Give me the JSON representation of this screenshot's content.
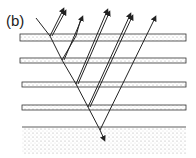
{
  "figure": {
    "panel_label": "(b)",
    "colors": {
      "line": "#222222",
      "layer_fill": "#e6e6e6",
      "substrate_fill": "#efefef"
    }
  }
}
